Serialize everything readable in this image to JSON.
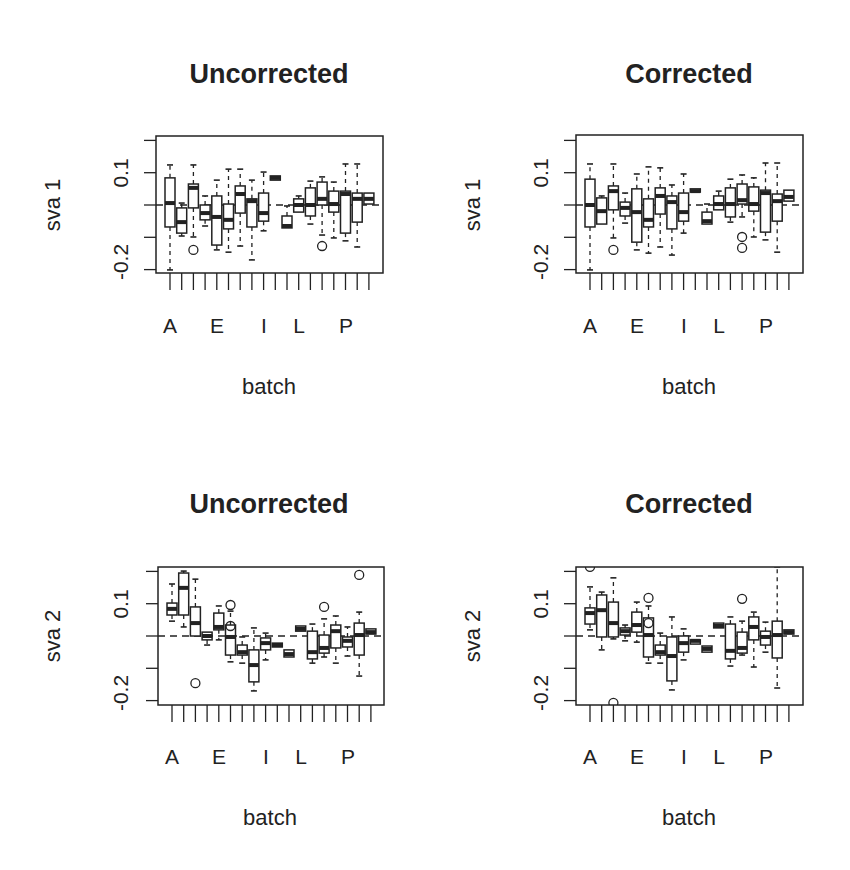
{
  "chart_data": [
    {
      "type": "boxplot",
      "panel": "top-left",
      "title": "Uncorrected",
      "xlabel": "batch",
      "ylabel": "sva 1",
      "ylim": [
        -0.21,
        0.22
      ],
      "yticks": [
        0.2,
        0.1,
        0.0,
        -0.1,
        -0.2
      ],
      "ytick_labels_shown": [
        "0.1",
        "-0.2"
      ],
      "xtick_labels_shown": {
        "A": 1,
        "E": 5,
        "I": 9,
        "L": 12,
        "P": 16
      },
      "reference_line": 0.0,
      "categories": [
        "A",
        "B",
        "C",
        "D",
        "E",
        "F",
        "G",
        "H",
        "I",
        "J",
        "K",
        "L",
        "M",
        "N",
        "O",
        "P",
        "Q",
        "R"
      ],
      "boxes": [
        {
          "lo": -0.201,
          "q1": -0.068,
          "med": 0.006,
          "q3": 0.084,
          "hi": 0.124,
          "out": []
        },
        {
          "lo": -0.096,
          "q1": -0.087,
          "med": -0.053,
          "q3": -0.009,
          "hi": 0.006,
          "out": []
        },
        {
          "lo": -0.099,
          "q1": -0.009,
          "med": 0.053,
          "q3": 0.065,
          "hi": 0.124,
          "out": [
            -0.139
          ]
        },
        {
          "lo": -0.065,
          "q1": -0.046,
          "med": -0.025,
          "q3": 0.0,
          "hi": 0.028,
          "out": []
        },
        {
          "lo": -0.139,
          "q1": -0.124,
          "med": -0.037,
          "q3": 0.028,
          "hi": 0.077,
          "out": []
        },
        {
          "lo": -0.146,
          "q1": -0.074,
          "med": -0.046,
          "q3": 0.003,
          "hi": 0.111,
          "out": []
        },
        {
          "lo": -0.127,
          "q1": -0.025,
          "med": 0.034,
          "q3": 0.059,
          "hi": 0.111,
          "out": []
        },
        {
          "lo": -0.17,
          "q1": -0.068,
          "med": 0.012,
          "q3": 0.019,
          "hi": 0.077,
          "out": []
        },
        {
          "lo": -0.08,
          "q1": -0.05,
          "med": -0.025,
          "q3": 0.037,
          "hi": 0.102,
          "out": []
        },
        {
          "lo": 0.077,
          "q1": 0.077,
          "med": 0.084,
          "q3": 0.09,
          "hi": 0.09,
          "out": []
        },
        {
          "lo": -0.071,
          "q1": -0.071,
          "med": -0.065,
          "q3": -0.034,
          "hi": -0.003,
          "out": []
        },
        {
          "lo": -0.022,
          "q1": -0.022,
          "med": 0.0,
          "q3": 0.019,
          "hi": 0.028,
          "out": []
        },
        {
          "lo": -0.059,
          "q1": -0.034,
          "med": 0.0,
          "q3": 0.053,
          "hi": 0.074,
          "out": []
        },
        {
          "lo": -0.093,
          "q1": 0.0,
          "med": 0.019,
          "q3": 0.071,
          "hi": 0.087,
          "out": [
            -0.127
          ]
        },
        {
          "lo": -0.102,
          "q1": -0.022,
          "med": 0.003,
          "q3": 0.043,
          "hi": 0.071,
          "out": []
        },
        {
          "lo": -0.111,
          "q1": -0.087,
          "med": 0.034,
          "q3": 0.043,
          "hi": 0.127,
          "out": []
        },
        {
          "lo": -0.13,
          "q1": -0.053,
          "med": 0.019,
          "q3": 0.037,
          "hi": 0.127,
          "out": []
        },
        {
          "lo": 0.003,
          "q1": 0.003,
          "med": 0.019,
          "q3": 0.037,
          "hi": 0.037,
          "out": []
        }
      ]
    },
    {
      "type": "boxplot",
      "panel": "top-right",
      "title": "Corrected",
      "xlabel": "batch",
      "ylabel": "sva 1",
      "ylim": [
        -0.21,
        0.22
      ],
      "yticks": [
        0.2,
        0.1,
        0.0,
        -0.1,
        -0.2
      ],
      "ytick_labels_shown": [
        "0.1",
        "-0.2"
      ],
      "xtick_labels_shown": {
        "A": 1,
        "E": 5,
        "I": 9,
        "L": 12,
        "P": 16
      },
      "reference_line": 0.0,
      "categories": [
        "A",
        "B",
        "C",
        "D",
        "E",
        "F",
        "G",
        "H",
        "I",
        "J",
        "K",
        "L",
        "M",
        "N",
        "O",
        "P",
        "Q",
        "R"
      ],
      "boxes": [
        {
          "lo": -0.201,
          "q1": -0.068,
          "med": 0.0,
          "q3": 0.08,
          "hi": 0.127,
          "out": []
        },
        {
          "lo": -0.059,
          "q1": -0.059,
          "med": -0.019,
          "q3": 0.022,
          "hi": 0.028,
          "out": []
        },
        {
          "lo": -0.102,
          "q1": -0.015,
          "med": 0.043,
          "q3": 0.059,
          "hi": 0.127,
          "out": [
            -0.139
          ]
        },
        {
          "lo": -0.056,
          "q1": -0.034,
          "med": -0.009,
          "q3": 0.009,
          "hi": 0.037,
          "out": []
        },
        {
          "lo": -0.139,
          "q1": -0.115,
          "med": -0.022,
          "q3": 0.05,
          "hi": 0.096,
          "out": []
        },
        {
          "lo": -0.149,
          "q1": -0.068,
          "med": -0.046,
          "q3": 0.019,
          "hi": 0.118,
          "out": []
        },
        {
          "lo": -0.13,
          "q1": -0.028,
          "med": 0.028,
          "q3": 0.053,
          "hi": 0.115,
          "out": []
        },
        {
          "lo": -0.155,
          "q1": -0.074,
          "med": 0.009,
          "q3": 0.028,
          "hi": 0.062,
          "out": []
        },
        {
          "lo": -0.087,
          "q1": -0.05,
          "med": -0.022,
          "q3": 0.037,
          "hi": 0.096,
          "out": []
        },
        {
          "lo": 0.04,
          "q1": 0.04,
          "med": 0.043,
          "q3": 0.05,
          "hi": 0.05,
          "out": []
        },
        {
          "lo": -0.059,
          "q1": -0.059,
          "med": -0.05,
          "q3": -0.022,
          "hi": 0.003,
          "out": []
        },
        {
          "lo": -0.015,
          "q1": -0.015,
          "med": 0.003,
          "q3": 0.028,
          "hi": 0.043,
          "out": []
        },
        {
          "lo": -0.053,
          "q1": -0.037,
          "med": 0.003,
          "q3": 0.053,
          "hi": 0.08,
          "out": []
        },
        {
          "lo": -0.037,
          "q1": 0.003,
          "med": 0.015,
          "q3": 0.065,
          "hi": 0.093,
          "out": [
            -0.099,
            -0.133
          ]
        },
        {
          "lo": -0.099,
          "q1": -0.019,
          "med": 0.003,
          "q3": 0.056,
          "hi": 0.084,
          "out": []
        },
        {
          "lo": -0.108,
          "q1": -0.084,
          "med": 0.037,
          "q3": 0.046,
          "hi": 0.13,
          "out": []
        },
        {
          "lo": -0.146,
          "q1": -0.05,
          "med": 0.012,
          "q3": 0.034,
          "hi": 0.13,
          "out": []
        },
        {
          "lo": 0.012,
          "q1": 0.012,
          "med": 0.025,
          "q3": 0.046,
          "hi": 0.046,
          "out": []
        }
      ]
    },
    {
      "type": "boxplot",
      "panel": "bottom-left",
      "title": "Uncorrected",
      "xlabel": "batch",
      "ylabel": "sva 2",
      "ylim": [
        -0.21,
        0.22
      ],
      "yticks": [
        0.2,
        0.1,
        0.0,
        -0.1,
        -0.2
      ],
      "ytick_labels_shown": [
        "0.1",
        "-0.2"
      ],
      "xtick_labels_shown": {
        "A": 1,
        "E": 5,
        "I": 9,
        "L": 12,
        "P": 16
      },
      "reference_line": 0.0,
      "categories": [
        "A",
        "B",
        "C",
        "D",
        "E",
        "F",
        "G",
        "H",
        "I",
        "J",
        "K",
        "L",
        "M",
        "N",
        "O",
        "P",
        "Q",
        "R"
      ],
      "boxes": [
        {
          "lo": 0.046,
          "q1": 0.065,
          "med": 0.084,
          "q3": 0.102,
          "hi": 0.161,
          "out": []
        },
        {
          "lo": 0.028,
          "q1": 0.065,
          "med": 0.149,
          "q3": 0.195,
          "hi": 0.201,
          "out": []
        },
        {
          "lo": 0.0,
          "q1": 0.0,
          "med": 0.04,
          "q3": 0.09,
          "hi": 0.176,
          "out": [
            -0.146
          ]
        },
        {
          "lo": -0.028,
          "q1": -0.012,
          "med": 0.0,
          "q3": 0.012,
          "hi": 0.012,
          "out": []
        },
        {
          "lo": -0.012,
          "q1": 0.019,
          "med": 0.028,
          "q3": 0.071,
          "hi": 0.093,
          "out": []
        },
        {
          "lo": -0.08,
          "q1": -0.059,
          "med": -0.003,
          "q3": 0.034,
          "hi": 0.077,
          "out": [
            0.096,
            0.031
          ]
        },
        {
          "lo": -0.084,
          "q1": -0.059,
          "med": -0.05,
          "q3": -0.028,
          "hi": -0.003,
          "out": []
        },
        {
          "lo": -0.17,
          "q1": -0.142,
          "med": -0.09,
          "q3": -0.043,
          "hi": 0.025,
          "out": []
        },
        {
          "lo": -0.074,
          "q1": -0.043,
          "med": -0.022,
          "q3": -0.006,
          "hi": 0.009,
          "out": []
        },
        {
          "lo": -0.034,
          "q1": -0.034,
          "med": -0.028,
          "q3": -0.022,
          "hi": -0.022,
          "out": []
        },
        {
          "lo": -0.065,
          "q1": -0.065,
          "med": -0.056,
          "q3": -0.043,
          "hi": -0.043,
          "out": []
        },
        {
          "lo": 0.015,
          "q1": 0.015,
          "med": 0.022,
          "q3": 0.031,
          "hi": 0.031,
          "out": []
        },
        {
          "lo": -0.084,
          "q1": -0.071,
          "med": -0.05,
          "q3": 0.015,
          "hi": 0.037,
          "out": []
        },
        {
          "lo": -0.065,
          "q1": -0.053,
          "med": -0.037,
          "q3": 0.003,
          "hi": 0.053,
          "out": [
            0.09
          ]
        },
        {
          "lo": -0.084,
          "q1": -0.037,
          "med": 0.015,
          "q3": 0.034,
          "hi": 0.062,
          "out": []
        },
        {
          "lo": -0.062,
          "q1": -0.034,
          "med": -0.015,
          "q3": -0.003,
          "hi": 0.028,
          "out": []
        },
        {
          "lo": -0.124,
          "q1": -0.059,
          "med": 0.003,
          "q3": 0.04,
          "hi": 0.074,
          "out": [
            0.189
          ]
        },
        {
          "lo": 0.006,
          "q1": 0.006,
          "med": 0.012,
          "q3": 0.022,
          "hi": 0.022,
          "out": []
        }
      ]
    },
    {
      "type": "boxplot",
      "panel": "bottom-right",
      "title": "Corrected",
      "xlabel": "batch",
      "ylabel": "sva 2",
      "ylim": [
        -0.21,
        0.22
      ],
      "yticks": [
        0.2,
        0.1,
        0.0,
        -0.1,
        -0.2
      ],
      "ytick_labels_shown": [
        "0.1",
        "-0.2"
      ],
      "xtick_labels_shown": {
        "A": 1,
        "E": 5,
        "I": 9,
        "L": 12,
        "P": 16
      },
      "reference_line": 0.0,
      "categories": [
        "A",
        "B",
        "C",
        "D",
        "E",
        "F",
        "G",
        "H",
        "I",
        "J",
        "K",
        "L",
        "M",
        "N",
        "O",
        "P",
        "Q",
        "R"
      ],
      "boxes": [
        {
          "lo": 0.019,
          "q1": 0.037,
          "med": 0.071,
          "q3": 0.087,
          "hi": 0.152,
          "out": [
            0.214
          ]
        },
        {
          "lo": -0.043,
          "q1": -0.003,
          "med": 0.08,
          "q3": 0.127,
          "hi": 0.136,
          "out": []
        },
        {
          "lo": -0.009,
          "q1": -0.003,
          "med": 0.04,
          "q3": 0.105,
          "hi": 0.18,
          "out": [
            -0.207
          ]
        },
        {
          "lo": -0.015,
          "q1": 0.003,
          "med": 0.015,
          "q3": 0.025,
          "hi": 0.034,
          "out": []
        },
        {
          "lo": -0.019,
          "q1": 0.012,
          "med": 0.034,
          "q3": 0.074,
          "hi": 0.105,
          "out": []
        },
        {
          "lo": -0.084,
          "q1": -0.065,
          "med": 0.003,
          "q3": 0.056,
          "hi": 0.093,
          "out": [
            0.118,
            0.04
          ]
        },
        {
          "lo": -0.084,
          "q1": -0.059,
          "med": -0.05,
          "q3": -0.028,
          "hi": 0.009,
          "out": []
        },
        {
          "lo": -0.167,
          "q1": -0.139,
          "med": -0.062,
          "q3": -0.003,
          "hi": 0.059,
          "out": []
        },
        {
          "lo": -0.074,
          "q1": -0.05,
          "med": -0.022,
          "q3": 0.0,
          "hi": 0.022,
          "out": []
        },
        {
          "lo": -0.025,
          "q1": -0.025,
          "med": -0.015,
          "q3": -0.012,
          "hi": -0.012,
          "out": []
        },
        {
          "lo": -0.05,
          "q1": -0.05,
          "med": -0.04,
          "q3": -0.031,
          "hi": -0.031,
          "out": []
        },
        {
          "lo": 0.025,
          "q1": 0.025,
          "med": 0.031,
          "q3": 0.04,
          "hi": 0.04,
          "out": []
        },
        {
          "lo": -0.093,
          "q1": -0.071,
          "med": -0.046,
          "q3": 0.037,
          "hi": 0.059,
          "out": []
        },
        {
          "lo": -0.059,
          "q1": -0.053,
          "med": -0.037,
          "q3": 0.012,
          "hi": 0.046,
          "out": [
            0.115
          ]
        },
        {
          "lo": -0.096,
          "q1": -0.012,
          "med": 0.028,
          "q3": 0.059,
          "hi": 0.074,
          "out": []
        },
        {
          "lo": -0.05,
          "q1": -0.028,
          "med": -0.003,
          "q3": 0.015,
          "hi": 0.043,
          "out": []
        },
        {
          "lo": -0.161,
          "q1": -0.068,
          "med": 0.003,
          "q3": 0.046,
          "hi": 0.214,
          "out": []
        },
        {
          "lo": 0.006,
          "q1": 0.006,
          "med": 0.012,
          "q3": 0.019,
          "hi": 0.019,
          "out": []
        }
      ]
    }
  ],
  "panels": [
    {
      "title": "Uncorrected",
      "ylabel": "sva 1",
      "xlabel": "batch",
      "ytick_top": "0.1",
      "ytick_bottom": "-0.2",
      "xlabels": [
        "A",
        "E",
        "I",
        "L",
        "P"
      ]
    },
    {
      "title": "Corrected",
      "ylabel": "sva 1",
      "xlabel": "batch",
      "ytick_top": "0.1",
      "ytick_bottom": "-0.2",
      "xlabels": [
        "A",
        "E",
        "I",
        "L",
        "P"
      ]
    },
    {
      "title": "Uncorrected",
      "ylabel": "sva 2",
      "xlabel": "batch",
      "ytick_top": "0.1",
      "ytick_bottom": "-0.2",
      "xlabels": [
        "A",
        "E",
        "I",
        "L",
        "P"
      ]
    },
    {
      "title": "Corrected",
      "ylabel": "sva 2",
      "xlabel": "batch",
      "ytick_top": "0.1",
      "ytick_bottom": "-0.2",
      "xlabels": [
        "A",
        "E",
        "I",
        "L",
        "P"
      ]
    }
  ],
  "colors": {
    "ink": "#222222",
    "median": "#222222",
    "background": "#ffffff"
  }
}
